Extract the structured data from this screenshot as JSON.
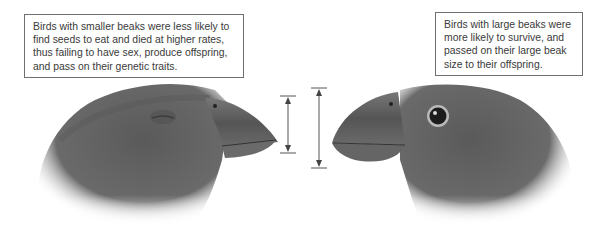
{
  "captions": {
    "small_beak": "Birds with smaller beaks were less likely to find seeds to eat and died at higher rates, thus failing to have sex, produce offspring, and pass on their genetic traits.",
    "large_beak": "Birds with large beaks were more likely to survive, and passed on their large beak size to their offspring."
  },
  "figures": {
    "left_bird": {
      "beak": "small",
      "eye": "closed",
      "facing": "right"
    },
    "right_bird": {
      "beak": "large",
      "eye": "open",
      "facing": "left"
    }
  },
  "measurements": {
    "small_beak_arrow": {
      "top_y": 96,
      "bottom_y": 153
    },
    "large_beak_arrow": {
      "top_y": 88,
      "bottom_y": 168
    }
  },
  "colors": {
    "feather_dark": "#4a4a4a",
    "feather_mid": "#6b6b6b",
    "beak": "#5c5c5c",
    "border": "#6f6f6f",
    "text": "#3a3a3a"
  }
}
